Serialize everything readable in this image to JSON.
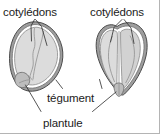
{
  "figure": {
    "background_color": "#ffffff",
    "labels": {
      "cotyledons_left": "cotylédons",
      "cotyledons_right": "cotylédons",
      "tegument": "tégument",
      "plantule": "plantule"
    },
    "colors": {
      "text": "#1b1b1b",
      "leader_line": "#2b2b2b",
      "seed_coat_fill": "#9e9e9e",
      "seed_coat_stroke": "#4a4a4a",
      "cotyledon_fill": "#dcdcdc",
      "cotyledon_stroke": "#8a8a8a",
      "embryo_fill": "#bdbdbd",
      "inner_cavity_fill": "#ffffff",
      "frame": "#b4b4b4"
    },
    "diagrams": [
      {
        "name": "seed-left",
        "description": "Graine en coupe longitudinale, vue inclinée, un seul cotylédon visible",
        "parts": [
          "tégument",
          "cotylédons",
          "plantule"
        ]
      },
      {
        "name": "seed-right",
        "description": "Graine en coupe, deux cotylédons écartés, plantule à la base",
        "parts": [
          "tégument",
          "cotylédons",
          "plantule"
        ]
      }
    ]
  }
}
